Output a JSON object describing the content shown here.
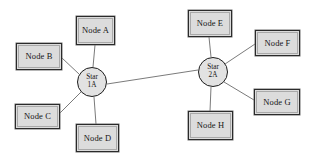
{
  "diagram": {
    "background_color": "#ffffff",
    "box_fill_color": "#dcdcdc",
    "box_border_color": "#2b2b2b",
    "hub_fill_color": "#e2e2e2",
    "hub_border_color": "#1d1d1d",
    "edge_color": "#6b6b6b",
    "hubs": [
      {
        "id": "star-1a",
        "line1": "Star",
        "line2": "1A",
        "cx": 92,
        "cy": 82,
        "r": 15
      },
      {
        "id": "star-2a",
        "line1": "Star",
        "line2": "2A",
        "cx": 213,
        "cy": 72,
        "r": 15
      }
    ],
    "nodes": [
      {
        "id": "node-a",
        "label": "Node A",
        "x": 76,
        "y": 16,
        "w": 39,
        "h": 29,
        "hub": "star-1a"
      },
      {
        "id": "node-b",
        "label": "Node B",
        "x": 16,
        "y": 43,
        "w": 46,
        "h": 27,
        "hub": "star-1a"
      },
      {
        "id": "node-c",
        "label": "Node C",
        "x": 15,
        "y": 104,
        "w": 45,
        "h": 25,
        "hub": "star-1a"
      },
      {
        "id": "node-d",
        "label": "Node D",
        "x": 76,
        "y": 124,
        "w": 43,
        "h": 28,
        "hub": "star-1a"
      },
      {
        "id": "node-e",
        "label": "Node E",
        "x": 188,
        "y": 10,
        "w": 44,
        "h": 27,
        "hub": "star-2a"
      },
      {
        "id": "node-f",
        "label": "Node F",
        "x": 255,
        "y": 30,
        "w": 45,
        "h": 26,
        "hub": "star-2a"
      },
      {
        "id": "node-g",
        "label": "Node G",
        "x": 254,
        "y": 89,
        "w": 46,
        "h": 26,
        "hub": "star-2a"
      },
      {
        "id": "node-h",
        "label": "Node H",
        "x": 188,
        "y": 111,
        "w": 45,
        "h": 29,
        "hub": "star-2a"
      }
    ],
    "edges": [
      {
        "id": "edge-star1a-node-a",
        "x1": 93,
        "y1": 67,
        "x2": 95,
        "y2": 45
      },
      {
        "id": "edge-star1a-node-b",
        "x1": 79,
        "y1": 74,
        "x2": 62,
        "y2": 58
      },
      {
        "id": "edge-star1a-node-c",
        "x1": 81,
        "y1": 92,
        "x2": 60,
        "y2": 113
      },
      {
        "id": "edge-star1a-node-d",
        "x1": 94,
        "y1": 97,
        "x2": 96,
        "y2": 124
      },
      {
        "id": "edge-star2a-node-e",
        "x1": 211,
        "y1": 57,
        "x2": 209,
        "y2": 37
      },
      {
        "id": "edge-star2a-node-f",
        "x1": 225,
        "y1": 64,
        "x2": 255,
        "y2": 44
      },
      {
        "id": "edge-star2a-node-g",
        "x1": 224,
        "y1": 82,
        "x2": 254,
        "y2": 100
      },
      {
        "id": "edge-star2a-node-h",
        "x1": 211,
        "y1": 87,
        "x2": 210,
        "y2": 111
      },
      {
        "id": "edge-star1a-star2a",
        "x1": 107,
        "y1": 84,
        "x2": 198,
        "y2": 70
      }
    ]
  }
}
